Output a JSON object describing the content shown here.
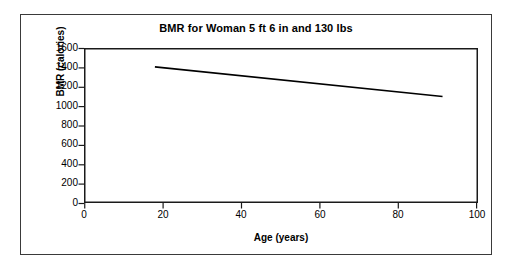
{
  "chart_data": {
    "type": "line",
    "title": "BMR for Woman 5 ft 6 in and 130 lbs",
    "xlabel": "Age (years)",
    "ylabel": "BMR (calories)",
    "xlim": [
      0,
      100
    ],
    "ylim": [
      0,
      1600
    ],
    "xticks": [
      0,
      20,
      40,
      60,
      80,
      100
    ],
    "yticks": [
      0,
      200,
      400,
      600,
      800,
      1000,
      1200,
      1400,
      1600
    ],
    "xtick_labels": [
      "0",
      "20",
      "40",
      "60",
      "80",
      "100"
    ],
    "ytick_labels": [
      "0",
      "200",
      "400",
      "600",
      "800",
      "1000",
      "1200",
      "1400",
      "1600"
    ],
    "grid": false,
    "legend": false,
    "series": [
      {
        "name": "BMR",
        "color": "#000000",
        "line_width": 1.6,
        "x": [
          18,
          91
        ],
        "y": [
          1405,
          1100
        ],
        "points": [
          {
            "x": 18,
            "y": 1405
          },
          {
            "x": 91,
            "y": 1100
          }
        ]
      }
    ]
  },
  "figure": {
    "background_color": "#ffffff",
    "frame_color": "#3a3a3a",
    "axis_color": "#000000",
    "text_color": "#000000"
  }
}
